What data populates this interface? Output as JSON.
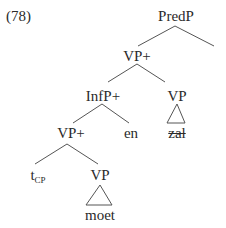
{
  "example_number": "(78)",
  "tree": {
    "root": "PredP",
    "nodes": {
      "predp": "PredP",
      "vp_plus_top": "VP+",
      "infp_plus": "InfP+",
      "vp_right": "VP",
      "vp_plus_low": "VP+",
      "en": "en",
      "zal": "zal",
      "t_base": "t",
      "t_sub": "CP",
      "vp_low": "VP",
      "moet": "moet"
    },
    "structure": [
      {
        "parent": "PredP",
        "children": [
          "VP+",
          "(empty)"
        ]
      },
      {
        "parent": "VP+",
        "children": [
          "InfP+",
          "VP"
        ]
      },
      {
        "parent": "InfP+",
        "children": [
          "VP+",
          "en"
        ]
      },
      {
        "parent": "VP",
        "children": [
          "zal (struck through, triangle)"
        ]
      },
      {
        "parent": "VP+",
        "children": [
          "t_CP",
          "VP"
        ]
      },
      {
        "parent": "VP",
        "children": [
          "moet (triangle)"
        ]
      }
    ]
  }
}
